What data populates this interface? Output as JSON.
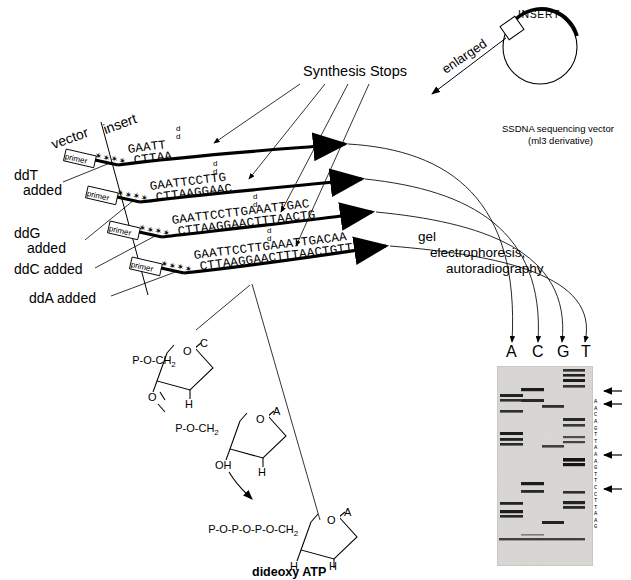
{
  "figure": {
    "title_labels": {
      "synthesis_stops": "Synthesis Stops",
      "enlarged": "enlarged",
      "insert_arc": "INSERT",
      "vector_caption_line1": "SSDNA sequencing vector",
      "vector_caption_line2": "(ml3 derivative)",
      "gel_step_line1": "gel",
      "gel_step_line2": "electrophoresis,",
      "gel_step_line3": "autoradiography"
    },
    "strand_area": {
      "vector_label": "vector",
      "insert_label": "insert",
      "primer_label": "primer",
      "primer_asterisks": "✶✶✶✶",
      "dd_marker_top": "d",
      "dd_marker_bottom": "d",
      "rows": [
        {
          "added_label_line1": "ddT",
          "added_label_line2": "added",
          "top_strand": "GAATT",
          "bottom_strand": "CTTAA"
        },
        {
          "added_label_line1": "ddG",
          "added_label_line2": "added",
          "top_strand": "GAATTCCTTG",
          "bottom_strand": "CTTAAGGAAC"
        },
        {
          "added_label_line1": "ddC added",
          "added_label_line2": "",
          "top_strand": "GAATTCCTTGAAATTGAC",
          "bottom_strand": "CTTAAGGAACTTTAACTG"
        },
        {
          "added_label_line1": "ddA added",
          "added_label_line2": "",
          "top_strand": "GAATTCCTTGAAATTGACAA",
          "bottom_strand": "CTTAAGGAACTTTAACTGTT"
        }
      ]
    },
    "chemistry": {
      "top_nucleotide": {
        "backbone": "P-O-CH",
        "backbone_sub": "2",
        "base": "C",
        "ring_oxygen": "O",
        "three_prime": "O",
        "two_prime_h": "H"
      },
      "middle_nucleotide": {
        "backbone": "P-O-CH",
        "backbone_sub": "2",
        "base": "A",
        "ring_oxygen": "O",
        "three_prime_oh": "OH",
        "two_prime_h": "H"
      },
      "dideoxy": {
        "triphosphate": "P-O-P-O-P-O-CH",
        "triphosphate_sub": "2",
        "base": "A",
        "ring_oxygen": "O",
        "three_prime_h": "H",
        "two_prime_h": "H",
        "caption": "dideoxy ATP"
      }
    },
    "gel": {
      "lane_labels": [
        "A",
        "C",
        "G",
        "T"
      ],
      "sequence_readout": "AACAGTTAAAGTTCCTTAAG",
      "arrow_markers": 4
    }
  },
  "colors": {
    "ink": "#000000",
    "gel_bg": "#d8d6d2",
    "band": "#1a1a1a"
  }
}
